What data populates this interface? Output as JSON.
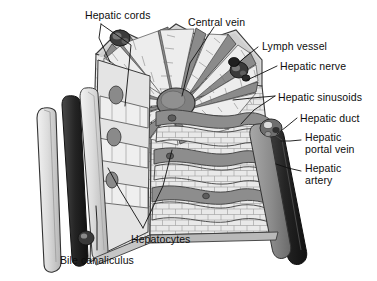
{
  "figure": {
    "background_color": "#ffffff",
    "text_color": "#0d0d0d",
    "palette": {
      "outline": "#2b2b2b",
      "cell_fill": "#e8e8e8",
      "sinusoid_mid": "#8e8e8e",
      "sinusoid_dark": "#6e6e6e",
      "vessel_dark": "#3a3a3a",
      "vessel_black": "#1c1c1c",
      "plate_light": "#d7d7d7",
      "shade_light": "#c2c2c2"
    }
  },
  "labels": [
    {
      "id": "hepatic-cords",
      "text": "Hepatic cords",
      "x": 85,
      "y": 10,
      "align": "left"
    },
    {
      "id": "central-vein",
      "text": "Central vein",
      "x": 188,
      "y": 17,
      "align": "left"
    },
    {
      "id": "lymph-vessel",
      "text": "Lymph vessel",
      "x": 262,
      "y": 41,
      "align": "left"
    },
    {
      "id": "hepatic-nerve",
      "text": "Hepatic nerve",
      "x": 280,
      "y": 61,
      "align": "left"
    },
    {
      "id": "hepatic-sinusoids",
      "text": "Hepatic sinusoids",
      "x": 278,
      "y": 92,
      "align": "left"
    },
    {
      "id": "hepatic-duct",
      "text": "Hepatic duct",
      "x": 300,
      "y": 113,
      "align": "left"
    },
    {
      "id": "hepatic-portal-vein",
      "text": "Hepatic\nportal vein",
      "x": 305,
      "y": 132,
      "align": "left"
    },
    {
      "id": "hepatic-artery",
      "text": "Hepatic\nartery",
      "x": 305,
      "y": 163,
      "align": "left"
    },
    {
      "id": "hepatocytes",
      "text": "Hepatocytes",
      "x": 131,
      "y": 234,
      "align": "left"
    },
    {
      "id": "bile-canaliculus",
      "text": "Bile canaliculus",
      "x": 60,
      "y": 255,
      "align": "left"
    }
  ],
  "leaders": [
    {
      "id": "leader-hepatic-cords-a",
      "points": "101,24 99,38 110,62"
    },
    {
      "id": "leader-hepatic-cords-b",
      "points": "101,24 131,45 125,106"
    },
    {
      "id": "leader-central-vein",
      "points": "214,27 190,63 182,96"
    },
    {
      "id": "leader-lymph-vessel",
      "points": "258,47 244,58 236,66"
    },
    {
      "id": "leader-hepatic-nerve",
      "points": "277,66 258,75 247,80"
    },
    {
      "id": "leader-hepatic-sinusoids-a",
      "points": "275,96 252,98 233,100"
    },
    {
      "id": "leader-hepatic-sinusoids-b",
      "points": "275,96 254,110 241,124"
    },
    {
      "id": "leader-hepatic-duct",
      "points": "297,118 286,127 277,134"
    },
    {
      "id": "leader-hepatic-portal-vein",
      "points": "301,140 290,141 281,141"
    },
    {
      "id": "leader-hepatic-artery",
      "points": "301,171 288,168 276,164"
    },
    {
      "id": "leader-hepatocytes-a",
      "points": "143,228 120,190 108,168"
    },
    {
      "id": "leader-hepatocytes-b",
      "points": "143,228 163,186 172,150"
    },
    {
      "id": "leader-bile-canaliculus",
      "points": "97,250 97,222 96,206"
    }
  ],
  "structures": {
    "central_vein": {
      "name": "central-vein-body",
      "cx": 176,
      "cy": 103
    },
    "radiating_sinusoid_count": 12,
    "corner_portal_triads": 3,
    "vertical_vessel_columns": 4
  }
}
